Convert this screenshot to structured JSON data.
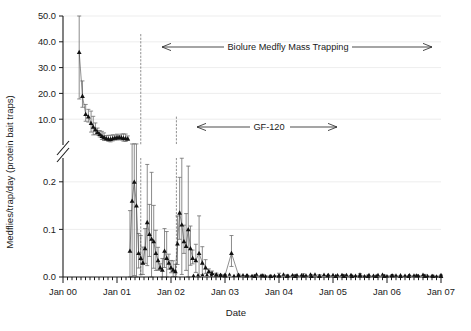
{
  "chart_data": {
    "type": "line",
    "title": "",
    "xlabel": "Date",
    "ylabel": "Medflies/trap/day (protein bait traps)",
    "grid": true,
    "legend_position": "none",
    "broken_axis": true,
    "axis_break_note": "y-axis broken between 0.2 and 10.0",
    "x_tick_labels": [
      "Jan 00",
      "Jan 01",
      "Jan 02",
      "Jan 03",
      "Jan 04",
      "Jan 05",
      "Jan 06",
      "Jan 07"
    ],
    "x_tick_values": [
      2000.0,
      2001.0,
      2002.0,
      2003.0,
      2004.0,
      2005.0,
      2006.0,
      2007.0
    ],
    "x_minor_tick_interval_months": 1,
    "xlim": [
      2000.0,
      2007.0
    ],
    "y_upper_tick_labels": [
      "10.0",
      "20.0",
      "30.0",
      "40.0",
      "50.0"
    ],
    "y_upper_tick_values": [
      10.0,
      20.0,
      30.0,
      40.0,
      50.0
    ],
    "y_upper_lim": [
      0.0,
      50.0
    ],
    "y_lower_tick_labels": [
      "0.0",
      "0.1",
      "0.2"
    ],
    "y_lower_tick_values": [
      0.0,
      0.1,
      0.2
    ],
    "y_lower_lim": [
      0.0,
      0.25
    ],
    "marker_style": "filled-triangle",
    "error_bars": "vertical",
    "series": [
      {
        "name": "Medflies per trap per day",
        "x": [
          2000.3,
          2000.36,
          2000.42,
          2000.47,
          2000.52,
          2000.56,
          2000.6,
          2000.64,
          2000.68,
          2000.72,
          2000.76,
          2000.8,
          2000.84,
          2000.88,
          2000.92,
          2000.96,
          2001.0,
          2001.04,
          2001.08,
          2001.12,
          2001.16,
          2001.2,
          2001.24,
          2001.28,
          2001.32,
          2001.36,
          2001.4,
          2001.44,
          2001.48,
          2001.52,
          2001.56,
          2001.6,
          2001.64,
          2001.68,
          2001.72,
          2001.76,
          2001.8,
          2001.84,
          2001.88,
          2001.92,
          2001.96,
          2002.0,
          2002.04,
          2002.08,
          2002.12,
          2002.16,
          2002.2,
          2002.24,
          2002.28,
          2002.32,
          2002.36,
          2002.4,
          2002.46,
          2002.52,
          2002.58,
          2002.64,
          2002.7,
          2002.76,
          2002.84,
          2002.92,
          2003.0,
          2003.12,
          2003.25,
          2003.4,
          2003.55,
          2003.7,
          2003.85,
          2004.0,
          2004.15,
          2004.3,
          2004.45,
          2004.6,
          2004.75,
          2004.9,
          2005.05,
          2005.2,
          2005.35,
          2005.5,
          2005.65,
          2005.8,
          2005.95,
          2006.1,
          2006.25,
          2006.4,
          2006.55,
          2006.7,
          2006.85,
          2007.0
        ],
        "y": [
          36.0,
          19.0,
          12.0,
          11.0,
          8.5,
          7.0,
          6.0,
          5.0,
          4.2,
          3.5,
          3.0,
          2.6,
          2.4,
          2.3,
          2.6,
          2.8,
          2.9,
          3.0,
          2.9,
          2.7,
          2.6,
          2.5,
          0.055,
          0.16,
          0.2,
          0.15,
          0.05,
          0.04,
          0.03,
          0.06,
          0.115,
          0.09,
          0.08,
          0.075,
          0.05,
          0.035,
          0.02,
          0.015,
          0.055,
          0.04,
          0.03,
          0.02,
          0.015,
          0.012,
          0.07,
          0.135,
          0.11,
          0.075,
          0.065,
          0.1,
          0.06,
          0.04,
          0.035,
          0.05,
          0.03,
          0.02,
          0.012,
          0.008,
          0.005,
          0.004,
          0.003,
          0.05,
          0.004,
          0.003,
          0.002,
          0.003,
          0.002,
          0.003,
          0.002,
          0.002,
          0.003,
          0.002,
          0.002,
          0.003,
          0.002,
          0.002,
          0.002,
          0.003,
          0.002,
          0.002,
          0.002,
          0.003,
          0.002,
          0.002,
          0.003,
          0.002,
          0.002,
          0.002
        ],
        "spikes": [
          {
            "x": 2001.44,
            "y": 43.0,
            "label": "tall spike 1"
          },
          {
            "x": 2002.1,
            "y": 11.0,
            "label": "tall spike 2"
          }
        ]
      }
    ],
    "annotations": [
      {
        "text": "Biolure Medfly Mass Trapping",
        "arrow": "double-headed",
        "x_start": 2001.45,
        "x_end": 2006.3,
        "y_level": 40.0
      },
      {
        "text": "GF-120",
        "arrow": "double-headed",
        "x_start": 2002.1,
        "x_end": 2004.55,
        "y_level": 11.0
      }
    ]
  }
}
